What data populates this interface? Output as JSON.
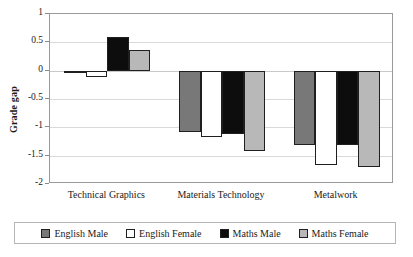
{
  "chart_data": {
    "type": "bar",
    "title": "",
    "xlabel": "",
    "ylabel": "Grade gap",
    "ylim": [
      -2,
      1
    ],
    "yticks": [
      "1",
      "0.5",
      "0",
      "-0.5",
      "-1",
      "-1.5",
      "-2"
    ],
    "ytick_values": [
      1,
      0.5,
      0,
      -0.5,
      -1,
      -1.5,
      -2
    ],
    "grid": true,
    "legend_position": "bottom",
    "categories": [
      "Technical Graphics",
      "Materials Technology",
      "Metalwork"
    ],
    "series": [
      {
        "name": "English Male",
        "color": "#787878",
        "values": [
          0.0,
          -1.08,
          -1.32
        ]
      },
      {
        "name": "English Female",
        "color": "#ffffff",
        "values": [
          -0.11,
          -1.17,
          -1.66
        ]
      },
      {
        "name": "Maths Male",
        "color": "#0d0d0d",
        "values": [
          0.6,
          -1.12,
          -1.32
        ]
      },
      {
        "name": "Maths Female",
        "color": "#b8b8b8",
        "values": [
          0.37,
          -1.42,
          -1.7
        ]
      }
    ]
  },
  "legend": {
    "items": [
      {
        "label": "English Male",
        "swatch": "#787878"
      },
      {
        "label": "English Female",
        "swatch": "#ffffff"
      },
      {
        "label": "Maths Male",
        "swatch": "#0d0d0d"
      },
      {
        "label": "Maths Female",
        "swatch": "#b8b8b8"
      }
    ]
  },
  "colors": {
    "axis": "#9a9a9a",
    "gridline": "#d9d9d9",
    "bar_border": "#1f1f1f",
    "text": "#1a1a1a"
  }
}
